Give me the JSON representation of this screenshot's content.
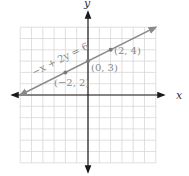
{
  "chart_data": {
    "type": "line",
    "title": "",
    "xlabel": "x",
    "ylabel": "y",
    "xlim": [
      -6,
      6
    ],
    "ylim": [
      -6,
      6
    ],
    "grid": true,
    "grid_step": 1,
    "series": [
      {
        "name": "-x + 2y = 6",
        "equation": "-x + 2y = 6",
        "slope": 0.5,
        "intercept": 3,
        "x_range": [
          -6,
          6
        ],
        "color": "#8a8a8a"
      }
    ],
    "points": [
      {
        "x": -2,
        "y": 2,
        "label": "(−2, 2)"
      },
      {
        "x": 0,
        "y": 3,
        "label": "(0, 3)"
      },
      {
        "x": 2,
        "y": 4,
        "label": "(2, 4)"
      }
    ],
    "annotations": [
      {
        "text": "−x + 2y = 6",
        "position": "along line, upper left"
      }
    ]
  },
  "labels": {
    "x_axis": "x",
    "y_axis": "y",
    "equation": "−x + 2y = 6",
    "p1": "(−2, 2)",
    "p2": "(0, 3)",
    "p3": "(2, 4)"
  },
  "colors": {
    "grid": "#d8d8d8",
    "axis": "#1a1a1a",
    "line": "#8a8a8a",
    "point": "#7a7a7a",
    "label": "#888888"
  }
}
